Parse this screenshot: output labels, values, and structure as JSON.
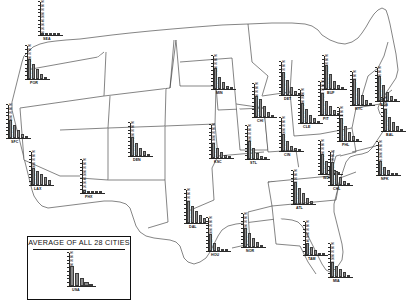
{
  "figure": {
    "type": "map-with-inset-bar-charts",
    "legend_title": "AVERAGE OF ALL 28 CITIES",
    "city_count": 28
  },
  "chart_data": {
    "type": "bar",
    "title": "AVERAGE OF ALL 28 CITIES",
    "xlabel": "",
    "ylabel": "",
    "ylim": [
      0,
      90
    ],
    "yticks": [
      0,
      10,
      20,
      30,
      40,
      50,
      60,
      70,
      80,
      90
    ],
    "ytick_labels": [
      "0",
      "10",
      "20",
      "30",
      "40",
      "50",
      "60",
      "70",
      "80",
      "90"
    ],
    "grid": false,
    "legend_position": "none",
    "categories": [
      "1",
      "2",
      "3",
      "4",
      "5"
    ],
    "series": [
      {
        "name": "SEA",
        "label": "SEA",
        "values": [
          5,
          3,
          2,
          1,
          1
        ]
      },
      {
        "name": "POR",
        "label": "POR",
        "values": [
          52,
          40,
          26,
          14,
          6
        ]
      },
      {
        "name": "SFC",
        "label": "SFC",
        "values": [
          48,
          34,
          20,
          10,
          4
        ]
      },
      {
        "name": "LAX",
        "label": "LAX",
        "values": [
          44,
          36,
          30,
          22,
          12
        ]
      },
      {
        "name": "PHX",
        "label": "PHX",
        "values": [
          7,
          4,
          3,
          2,
          1
        ]
      },
      {
        "name": "DEN",
        "label": "DEN",
        "values": [
          50,
          34,
          20,
          12,
          6
        ]
      },
      {
        "name": "MIN",
        "label": "MIN",
        "values": [
          55,
          32,
          18,
          9,
          4
        ]
      },
      {
        "name": "KSC",
        "label": "KSC",
        "values": [
          40,
          26,
          16,
          9,
          4
        ]
      },
      {
        "name": "DAL",
        "label": "DAL",
        "values": [
          58,
          44,
          32,
          22,
          13
        ]
      },
      {
        "name": "HOU",
        "label": "HOU",
        "values": [
          46,
          22,
          11,
          5,
          2
        ]
      },
      {
        "name": "NOR",
        "label": "NOR",
        "values": [
          50,
          38,
          24,
          13,
          6
        ]
      },
      {
        "name": "STL",
        "label": "STL",
        "values": [
          48,
          28,
          16,
          8,
          4
        ]
      },
      {
        "name": "CHI",
        "label": "CHI",
        "values": [
          56,
          48,
          28,
          14,
          6
        ]
      },
      {
        "name": "DET",
        "label": "DET",
        "values": [
          62,
          40,
          22,
          11,
          5
        ]
      },
      {
        "name": "CIN",
        "label": "CIN",
        "values": [
          44,
          26,
          14,
          7,
          3
        ]
      },
      {
        "name": "CLE",
        "label": "CLE",
        "values": [
          54,
          36,
          22,
          12,
          5
        ]
      },
      {
        "name": "PIT",
        "label": "PIT",
        "values": [
          58,
          38,
          23,
          12,
          5
        ]
      },
      {
        "name": "BUF",
        "label": "BUF",
        "values": [
          64,
          40,
          22,
          11,
          5
        ]
      },
      {
        "name": "NYC",
        "label": "NYC",
        "values": [
          70,
          46,
          27,
          14,
          6
        ]
      },
      {
        "name": "PHL",
        "label": "PHL",
        "values": [
          60,
          40,
          24,
          13,
          6
        ]
      },
      {
        "name": "BOS",
        "label": "BOS",
        "values": [
          66,
          42,
          24,
          12,
          5
        ]
      },
      {
        "name": "BAL",
        "label": "BAL",
        "values": [
          58,
          38,
          23,
          12,
          5
        ]
      },
      {
        "name": "WDC",
        "label": "WDC",
        "values": [
          52,
          34,
          20,
          10,
          4
        ]
      },
      {
        "name": "NFK",
        "label": "NFK",
        "values": [
          36,
          22,
          12,
          6,
          3
        ]
      },
      {
        "name": "CHL",
        "label": "CHL",
        "values": [
          62,
          36,
          20,
          10,
          4
        ]
      },
      {
        "name": "ATL",
        "label": "ATL",
        "values": [
          58,
          42,
          28,
          16,
          8
        ]
      },
      {
        "name": "TAM",
        "label": "TAM",
        "values": [
          32,
          20,
          12,
          6,
          3
        ]
      },
      {
        "name": "MIA",
        "label": "MIA",
        "values": [
          40,
          30,
          20,
          12,
          6
        ]
      },
      {
        "name": "USA",
        "label": "USA",
        "values": [
          52,
          34,
          20,
          11,
          5
        ]
      }
    ]
  },
  "cities": [
    {
      "code": "SEA",
      "x": 40,
      "y": 2,
      "label_dx": 12,
      "label_dy": 44,
      "values": [
        5,
        3,
        2,
        1,
        1
      ]
    },
    {
      "code": "POR",
      "x": 27,
      "y": 46,
      "label_dx": 11,
      "label_dy": 44,
      "values": [
        52,
        40,
        26,
        14,
        6
      ]
    },
    {
      "code": "SFC",
      "x": 8,
      "y": 105,
      "label_dx": 11,
      "label_dy": 44,
      "values": [
        48,
        34,
        20,
        10,
        4
      ]
    },
    {
      "code": "LAX",
      "x": 31,
      "y": 152,
      "label_dx": 11,
      "label_dy": 44,
      "values": [
        44,
        36,
        30,
        22,
        12
      ]
    },
    {
      "code": "PHX",
      "x": 82,
      "y": 160,
      "label_dx": 11,
      "label_dy": 44,
      "values": [
        7,
        4,
        3,
        2,
        1
      ]
    },
    {
      "code": "DEN",
      "x": 130,
      "y": 123,
      "label_dx": 11,
      "label_dy": 44,
      "values": [
        50,
        34,
        20,
        12,
        6
      ]
    },
    {
      "code": "MIN",
      "x": 213,
      "y": 56,
      "label_dx": 11,
      "label_dy": 44,
      "values": [
        55,
        32,
        18,
        9,
        4
      ]
    },
    {
      "code": "KSC",
      "x": 211,
      "y": 125,
      "label_dx": 11,
      "label_dy": 44,
      "values": [
        40,
        26,
        16,
        9,
        4
      ]
    },
    {
      "code": "DAL",
      "x": 186,
      "y": 190,
      "label_dx": 11,
      "label_dy": 44,
      "values": [
        58,
        44,
        32,
        22,
        13
      ]
    },
    {
      "code": "HOU",
      "x": 208,
      "y": 218,
      "label_dx": 11,
      "label_dy": 44,
      "values": [
        46,
        22,
        11,
        5,
        2
      ]
    },
    {
      "code": "NOR",
      "x": 243,
      "y": 214,
      "label_dx": 11,
      "label_dy": 44,
      "values": [
        50,
        38,
        24,
        13,
        6
      ]
    },
    {
      "code": "STL",
      "x": 247,
      "y": 126,
      "label_dx": 11,
      "label_dy": 44,
      "values": [
        48,
        28,
        16,
        8,
        4
      ]
    },
    {
      "code": "CHI",
      "x": 254,
      "y": 84,
      "label_dx": 11,
      "label_dy": 44,
      "values": [
        56,
        48,
        28,
        14,
        6
      ]
    },
    {
      "code": "DET",
      "x": 281,
      "y": 62,
      "label_dx": 11,
      "label_dy": 44,
      "values": [
        62,
        40,
        22,
        11,
        5
      ]
    },
    {
      "code": "CIN",
      "x": 281,
      "y": 118,
      "label_dx": 11,
      "label_dy": 44,
      "values": [
        44,
        26,
        14,
        7,
        3
      ]
    },
    {
      "code": "CLE",
      "x": 300,
      "y": 90,
      "label_dx": 11,
      "label_dy": 44,
      "values": [
        54,
        36,
        22,
        12,
        5
      ]
    },
    {
      "code": "PIT",
      "x": 320,
      "y": 82,
      "label_dx": 11,
      "label_dy": 44,
      "values": [
        58,
        38,
        23,
        12,
        5
      ]
    },
    {
      "code": "BUF",
      "x": 324,
      "y": 56,
      "label_dx": 11,
      "label_dy": 44,
      "values": [
        64,
        40,
        22,
        11,
        5
      ]
    },
    {
      "code": "NYC",
      "x": 352,
      "y": 72,
      "label_dx": 11,
      "label_dy": 44,
      "values": [
        70,
        46,
        27,
        14,
        6
      ]
    },
    {
      "code": "PHL",
      "x": 339,
      "y": 108,
      "label_dx": 11,
      "label_dy": 44,
      "values": [
        60,
        40,
        24,
        13,
        6
      ]
    },
    {
      "code": "BOS",
      "x": 377,
      "y": 68,
      "label_dx": 11,
      "label_dy": 44,
      "values": [
        66,
        42,
        24,
        12,
        5
      ]
    },
    {
      "code": "BAL",
      "x": 383,
      "y": 98,
      "label_dx": 11,
      "label_dy": 44,
      "values": [
        58,
        38,
        23,
        12,
        5
      ]
    },
    {
      "code": "WDC",
      "x": 320,
      "y": 141,
      "label_dx": 11,
      "label_dy": 44,
      "values": [
        52,
        34,
        20,
        10,
        4
      ]
    },
    {
      "code": "NFK",
      "x": 378,
      "y": 142,
      "label_dx": 11,
      "label_dy": 44,
      "values": [
        36,
        22,
        12,
        6,
        3
      ]
    },
    {
      "code": "CHL",
      "x": 330,
      "y": 152,
      "label_dx": 11,
      "label_dy": 44,
      "values": [
        62,
        36,
        20,
        10,
        4
      ]
    },
    {
      "code": "ATL",
      "x": 293,
      "y": 171,
      "label_dx": 11,
      "label_dy": 44,
      "values": [
        58,
        42,
        28,
        16,
        8
      ]
    },
    {
      "code": "TAM",
      "x": 305,
      "y": 222,
      "label_dx": 11,
      "label_dy": 44,
      "values": [
        32,
        20,
        12,
        6,
        3
      ]
    },
    {
      "code": "MIA",
      "x": 330,
      "y": 244,
      "label_dx": 11,
      "label_dy": 44,
      "values": [
        40,
        30,
        20,
        12,
        6
      ]
    }
  ],
  "legend": {
    "title": "AVERAGE OF ALL 28 CITIES",
    "chart": {
      "code": "USA",
      "values": [
        52,
        34,
        20,
        11,
        5
      ]
    },
    "box": {
      "x": 27,
      "y": 236,
      "w": 102,
      "h": 62
    }
  }
}
